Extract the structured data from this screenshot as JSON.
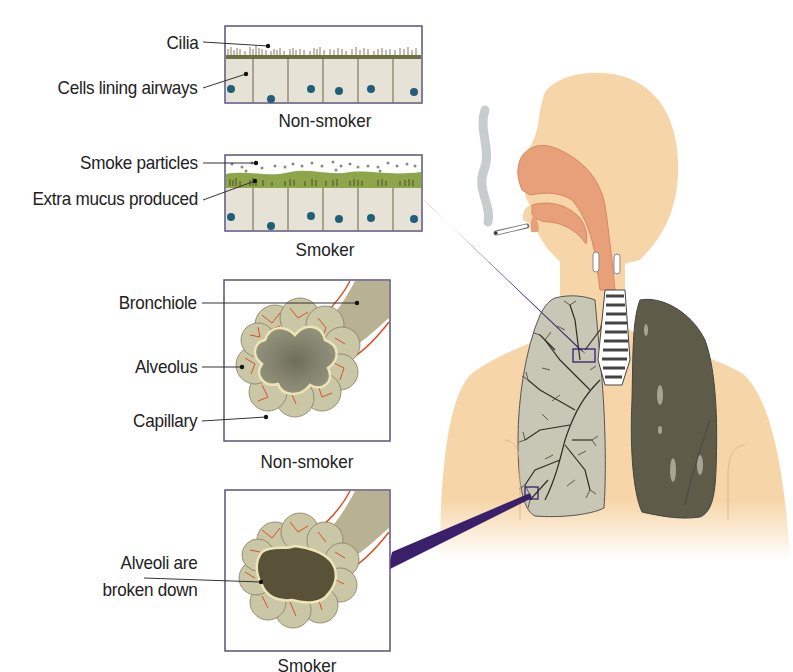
{
  "diagram": {
    "panels": [
      {
        "id": "airway-non-smoker",
        "caption": "Non-smoker",
        "labels": [
          "Cilia",
          "Cells lining airways"
        ]
      },
      {
        "id": "airway-smoker",
        "caption": "Smoker",
        "labels": [
          "Smoke particles",
          "Extra mucus produced"
        ]
      },
      {
        "id": "alveoli-non-smoker",
        "caption": "Non-smoker",
        "labels": [
          "Bronchiole",
          "Alveolus",
          "Capillary"
        ]
      },
      {
        "id": "alveoli-smoker",
        "caption": "Smoker",
        "labels": [
          "Alveoli are",
          "broken down"
        ]
      }
    ],
    "colors": {
      "skin": "#f6d6a8",
      "airway_tissue": "#e8a07a",
      "healthy_lung": "#c8c6b4",
      "smoker_lung": "#5e5c48",
      "pointer": "#3a1f6a",
      "panel_border": "#5a5478",
      "mucus": "#8ea64a",
      "cell": "#e6e2d6",
      "nucleus": "#1f5f78",
      "capillary": "#d8502a",
      "alveolus": "#c9c7a6"
    }
  }
}
